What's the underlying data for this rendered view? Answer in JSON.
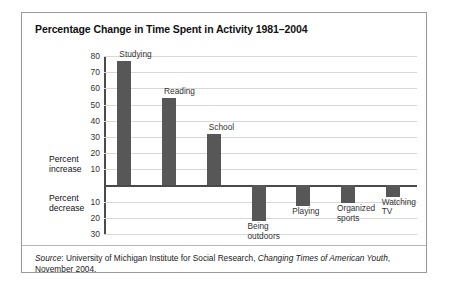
{
  "figure": {
    "title": "Percentage Change in Time Spent in Activity 1981–2004",
    "axis_captions": {
      "increase_line1": "Percent",
      "increase_line2": "increase",
      "decrease_line1": "Percent",
      "decrease_line2": "decrease"
    },
    "source": {
      "prefix": "Source",
      "colon": ": ",
      "org": "University of Michigan Institute for Social Research, ",
      "publication": "Changing Times of American Youth",
      "tail": ", November 2004."
    },
    "colors": {
      "bar": "#575757",
      "grid": "#d8d8d8",
      "axis": "#4a4a4a",
      "border": "#9a9a9a",
      "background": "#ffffff"
    }
  },
  "chart_data": {
    "type": "bar",
    "title": "Percentage Change in Time Spent in Activity 1981–2004",
    "xlabel": "",
    "ylabel": "",
    "ylim": [
      -30,
      80
    ],
    "grid": true,
    "legend": "none",
    "yticks": [
      80,
      70,
      60,
      50,
      40,
      30,
      20,
      10,
      -10,
      -20,
      -30
    ],
    "ytick_labels": [
      "80",
      "70",
      "60",
      "50",
      "40",
      "30",
      "20",
      "10",
      "10",
      "20",
      "30"
    ],
    "categories": [
      "Studying",
      "Reading",
      "School",
      "Being outdoors",
      "Playing",
      "Organized sports",
      "Watching TV"
    ],
    "category_labels": [
      [
        "Studying"
      ],
      [
        "Reading"
      ],
      [
        "School"
      ],
      [
        "Being",
        "outdoors"
      ],
      [
        "Playing"
      ],
      [
        "Organized",
        "sports"
      ],
      [
        "Watching",
        "TV"
      ]
    ],
    "values": [
      77,
      54,
      32,
      -22,
      -13,
      -11,
      -7
    ]
  }
}
